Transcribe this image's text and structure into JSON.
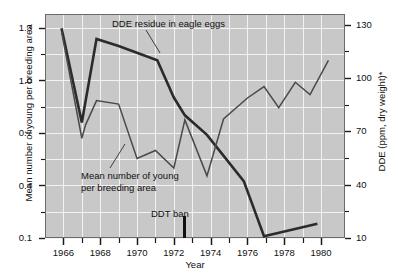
{
  "chart_data": {
    "type": "line",
    "title": "",
    "xlabel": "Year",
    "ylabel": "Mean number of young per breeding area",
    "ylabel_right": "DDE (ppm, dry weight)*",
    "xlim": [
      1965.0,
      1981.3
    ],
    "ylim_left": [
      0.1,
      1.38
    ],
    "ylim_right": [
      10,
      136
    ],
    "grid": true,
    "legend": "none",
    "x_ticks_major": [
      1966,
      1968,
      1970,
      1972,
      1974,
      1976,
      1978,
      1980
    ],
    "x_tick_labels": [
      "1966",
      "1968",
      "1970",
      "1972",
      "1974",
      "1976",
      "1978",
      "1980"
    ],
    "x_ticks_minor": [
      1967,
      1969,
      1971,
      1973,
      1975,
      1977,
      1979
    ],
    "y_ticks_left": [
      0.1,
      0.4,
      0.7,
      1.0,
      1.3
    ],
    "y_tick_labels_left": [
      "0.1",
      "0.4",
      "0.7",
      "1.0",
      "1.3"
    ],
    "y_ticks_right": [
      10,
      40,
      70,
      100,
      130
    ],
    "y_tick_labels_right": [
      "10",
      "40",
      "70",
      "100",
      "130"
    ],
    "series": [
      {
        "name": "DDE residue in eagle eggs",
        "axis": "right",
        "style": "thick",
        "color": "#2b2b2b",
        "x": [
          1965.9,
          1967.0,
          1967.8,
          1969.0,
          1971.1,
          1972.0,
          1972.6,
          1973.8,
          1975.8,
          1976.9,
          1979.8
        ],
        "values": [
          128,
          75,
          122,
          118,
          110,
          89,
          79,
          68,
          42,
          11,
          18
        ]
      },
      {
        "name": "Mean number of young per breeding area",
        "axis": "left",
        "style": "thin",
        "color": "#4a4a4a",
        "x": [
          1965.9,
          1967.0,
          1967.2,
          1967.8,
          1969.0,
          1970.0,
          1971.0,
          1972.0,
          1972.6,
          1973.8,
          1974.7,
          1976.0,
          1976.9,
          1977.7,
          1978.6,
          1979.4,
          1980.4
        ],
        "values": [
          1.28,
          0.67,
          0.745,
          0.885,
          0.865,
          0.555,
          0.6,
          0.5,
          0.775,
          0.455,
          0.78,
          0.9,
          0.965,
          0.845,
          0.99,
          0.92,
          1.115
        ]
      }
    ],
    "annotations": [
      {
        "name": "dde-residue-label",
        "text": "DDE residue in eagle eggs",
        "x_px": 112,
        "y_px": 18,
        "has_leader": true,
        "leader": [
          [
            146,
            30
          ],
          [
            160,
            53
          ]
        ]
      },
      {
        "name": "mean-young-label",
        "text_line1": "Mean number of young",
        "text_line2": "per breeding area",
        "x_px": 81,
        "y_px": 170,
        "has_leader": true,
        "leader": [
          [
            110,
            168
          ],
          [
            125,
            144
          ]
        ]
      },
      {
        "name": "ddt-ban-marker",
        "text": "DDT ban",
        "x_value": 1972.55,
        "label_x_px": 151,
        "label_y_px": 208
      }
    ]
  },
  "footnote": {
    "text": ""
  }
}
